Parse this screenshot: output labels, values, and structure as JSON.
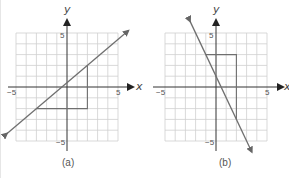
{
  "chart_data": [
    {
      "type": "line",
      "panel_label": "(a)",
      "xlabel": "x",
      "ylabel": "y",
      "xlim": [
        -5,
        5
      ],
      "ylim": [
        -5,
        5
      ],
      "grid": true,
      "tick_labels": {
        "x_min": "−5",
        "x_max": "5",
        "y_max": "5",
        "y_min": "−5"
      },
      "line": {
        "slope": 0.8,
        "intercept": 0.4,
        "points": [
          [
            -3,
            -2
          ],
          [
            2,
            2
          ]
        ],
        "arrows": "both"
      },
      "slope_triangle": {
        "vertices": [
          [
            -3,
            -2
          ],
          [
            2,
            -2
          ],
          [
            2,
            2
          ]
        ],
        "run": 5,
        "rise": 4
      }
    },
    {
      "type": "line",
      "panel_label": "(b)",
      "xlabel": "x",
      "ylabel": "y",
      "xlim": [
        -5,
        5
      ],
      "ylim": [
        -5,
        5
      ],
      "grid": true,
      "tick_labels": {
        "x_min": "−5",
        "x_max": "5",
        "y_max": "5",
        "y_min": "−5"
      },
      "line": {
        "slope": -2,
        "intercept": 1,
        "points": [
          [
            -1,
            3
          ],
          [
            2,
            -3
          ]
        ],
        "arrows": "both"
      },
      "slope_triangle": {
        "vertices": [
          [
            -1,
            3
          ],
          [
            2,
            3
          ],
          [
            2,
            -3
          ]
        ],
        "run": 3,
        "rise": -6
      }
    }
  ],
  "colors": {
    "grid": "#cfcfcf",
    "axis": "#333333",
    "line": "#6f6f6f",
    "triangle": "#6f6f6f"
  }
}
